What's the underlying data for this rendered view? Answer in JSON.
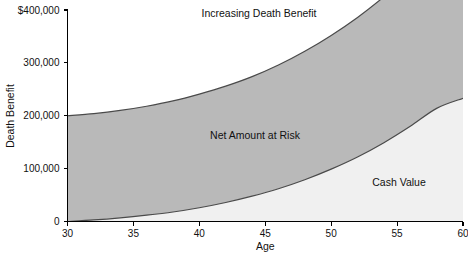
{
  "chart_data": {
    "type": "area",
    "title": "",
    "xlabel": "Age",
    "ylabel": "Death Benefit",
    "xlim": [
      30,
      60
    ],
    "ylim": [
      0,
      400000
    ],
    "grid": false,
    "legend_position": "inline-annotations",
    "xticks": [
      30,
      35,
      40,
      45,
      50,
      55,
      60
    ],
    "xtick_labels": [
      "30",
      "35",
      "40",
      "45",
      "50",
      "55",
      "60"
    ],
    "yticks": [
      0,
      100000,
      200000,
      300000,
      400000
    ],
    "ytick_labels": [
      "0",
      "100,000",
      "200,000",
      "300,000",
      "$400,000"
    ],
    "x": [
      30,
      32,
      34,
      36,
      38,
      40,
      42,
      44,
      46,
      48,
      50,
      52,
      54,
      56,
      58,
      60
    ],
    "series": [
      {
        "name": "Increasing Death Benefit",
        "role": "upper-boundary",
        "values": [
          200000,
          204000,
          210000,
          218000,
          228000,
          241000,
          256000,
          274000,
          296000,
          322000,
          352000,
          386000,
          425000,
          469000,
          518000,
          572000
        ]
      },
      {
        "name": "Cash Value",
        "role": "lower-boundary",
        "values": [
          0,
          3000,
          7000,
          12000,
          18000,
          26000,
          36000,
          48000,
          62000,
          79000,
          99000,
          122000,
          149000,
          180000,
          214000,
          233000
        ]
      }
    ],
    "bands": [
      {
        "name": "Net Amount at Risk",
        "between": [
          "Increasing Death Benefit",
          "Cash Value"
        ],
        "fill": "#b9b9b9"
      },
      {
        "name": "Cash Value",
        "between": [
          "Cash Value",
          "zero"
        ],
        "fill": "#f0f0f0"
      }
    ],
    "annotations": [
      {
        "name": "increasing-death-benefit",
        "text": "Increasing Death Benefit",
        "x_px": 259,
        "y_px": 9
      },
      {
        "name": "net-amount-at-risk",
        "text": "Net Amount at Risk",
        "x_px": 255,
        "y_px": 131
      },
      {
        "name": "cash-value",
        "text": "Cash Value",
        "x_px": 399,
        "y_px": 178
      }
    ],
    "colors": {
      "net_amount_at_risk_fill": "#b9b9b9",
      "cash_value_fill": "#f0f0f0",
      "curve_stroke": "#4a4a4a",
      "axis_stroke": "#000000",
      "text": "#111111",
      "background": "#ffffff"
    }
  }
}
